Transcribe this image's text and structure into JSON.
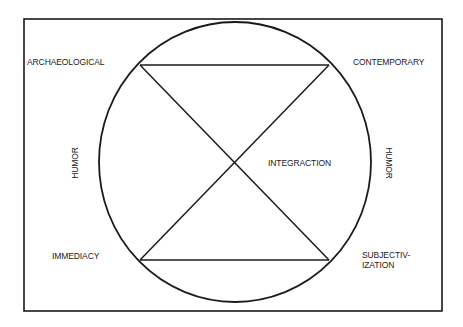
{
  "diagram": {
    "type": "circle-with-inscribed-hourglass",
    "stroke_color": "#1a1a1a",
    "background_color": "#ffffff",
    "frame": {
      "x": 24,
      "y": 19,
      "width": 418,
      "height": 292
    },
    "circle": {
      "cx": 235,
      "cy": 162,
      "rx": 136,
      "ry": 140
    },
    "chord_points": {
      "top_left": [
        140,
        65
      ],
      "top_right": [
        329,
        65
      ],
      "bottom_left": [
        140,
        260
      ],
      "bottom_right": [
        329,
        260
      ]
    },
    "labels": {
      "top_left": "ARCHAEOLOGICAL",
      "top_right": "CONTEMPORARY",
      "bottom_left": "IMMEDIACY",
      "bottom_right_line1": "SUBJECTIV-",
      "bottom_right_line2": "IZATION",
      "center": "INTEGRACTION",
      "left_side": "HUMOR",
      "right_side": "HUMOR"
    }
  }
}
